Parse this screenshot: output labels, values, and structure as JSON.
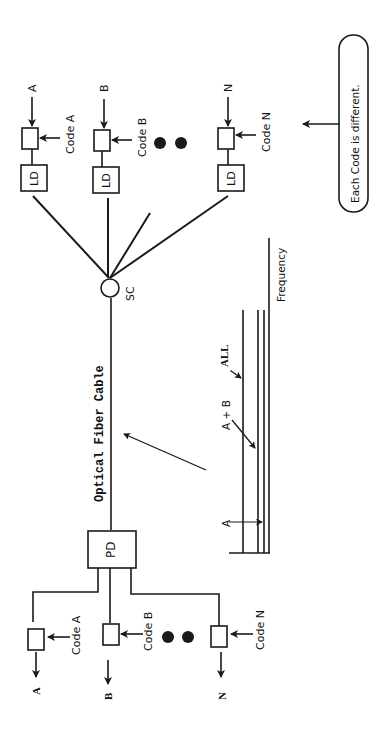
{
  "diagram": {
    "orientation": "rotated-90-ccw",
    "stroke_color": "#1a1a1a",
    "background": "#ffffff",
    "transmitters": [
      {
        "input_label": "A",
        "code_label": "Code A",
        "source_label": "LD"
      },
      {
        "input_label": "B",
        "code_label": "Code B",
        "source_label": "LD"
      },
      {
        "input_label": "N",
        "code_label": "Code N",
        "source_label": "LD"
      }
    ],
    "combiner_label": "SC",
    "fiber_label": "Optical Fiber Cable",
    "detector_label": "PD",
    "receivers": [
      {
        "output_label": "A",
        "code_label": "Code A"
      },
      {
        "output_label": "B",
        "code_label": "Code B"
      },
      {
        "output_label": "N",
        "code_label": "Code N"
      }
    ],
    "note": "Each Code is different.",
    "ellipsis": "●●",
    "spectrum": {
      "axis_label": "Frequency",
      "labels": {
        "single": "A",
        "pair": "A + B",
        "all": "ALL"
      }
    }
  }
}
